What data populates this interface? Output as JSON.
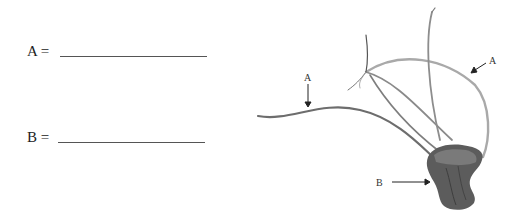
{
  "worksheet": {
    "fields": [
      {
        "label": "A =",
        "value": ""
      },
      {
        "label": "B =",
        "value": ""
      }
    ]
  },
  "figure": {
    "labels": {
      "a_left": "A",
      "a_right": "A",
      "b": "B"
    }
  }
}
